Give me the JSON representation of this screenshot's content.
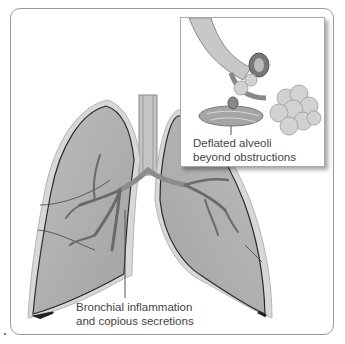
{
  "figure": {
    "labels": {
      "bronchial": {
        "line1": "Bronchial inflammation",
        "line2": "and copious secretions"
      },
      "alveoli": {
        "line1": "Deflated alveoli",
        "line2": "beyond obstructions"
      }
    },
    "colors": {
      "lung_fill": "#a9a9a9",
      "lung_edge": "#2a2a2a",
      "pleura": "#d6d6d6",
      "bronchi": "#8c8c8c",
      "alveoli": "#cfcfcf",
      "frame": "#9a9a9a"
    }
  }
}
